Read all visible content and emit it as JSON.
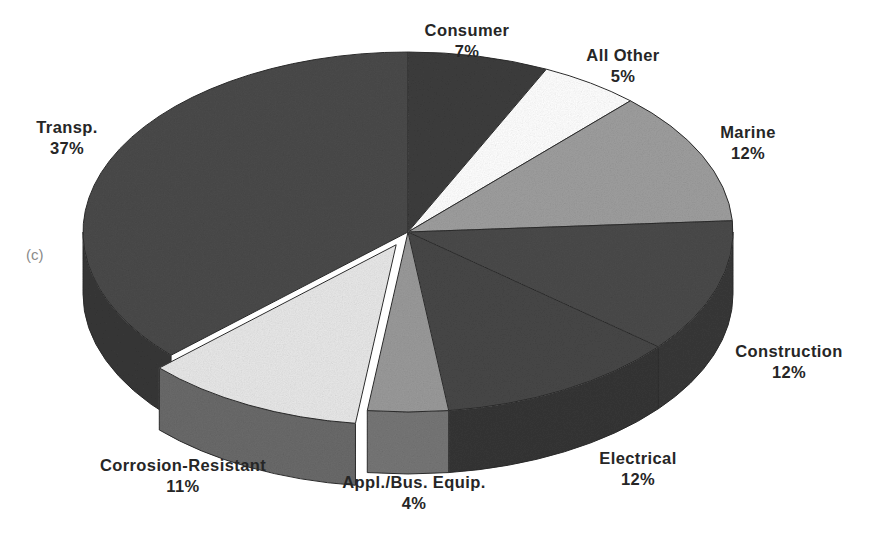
{
  "figure": {
    "tag": "(c)",
    "tag_color": "#8a8a8a"
  },
  "chart_data": {
    "type": "pie",
    "title": "",
    "subtitle": "",
    "xlabel": "",
    "ylabel": "",
    "legend_position": "none",
    "grid": false,
    "three_d": true,
    "start_angle_deg": -90,
    "direction": "clockwise",
    "total_percent": 100,
    "categories": [
      "Consumer",
      "All Other",
      "Marine",
      "Construction",
      "Electrical",
      "Appl./Bus. Equip.",
      "Corrosion-Resistant",
      "Transp."
    ],
    "values": [
      7,
      5,
      12,
      12,
      12,
      4,
      11,
      37
    ],
    "labels": [
      "Consumer 7%",
      "All Other 5%",
      "Marine 12%",
      "Construction 12%",
      "Electrical 12%",
      "Appl./Bus. Equip. 4%",
      "Corrosion-Resistant 11%",
      "Transp. 37%"
    ],
    "colors": [
      "#3d3d3d",
      "#ffffff",
      "#9e9e9e",
      "#4a4a4a",
      "#474747",
      "#9a9a9a",
      "#e8e8e8",
      "#4a4a4a"
    ],
    "exploded": [
      false,
      false,
      false,
      false,
      false,
      false,
      true,
      false
    ]
  },
  "slices": [
    {
      "key": "consumer",
      "name": "Consumer",
      "pct": "7%",
      "value": 7,
      "color": "#3d3d3d",
      "side_color": "#2e2e2e",
      "exploded": false,
      "label_x": 467,
      "label_y": 20,
      "label_align": "center"
    },
    {
      "key": "all-other",
      "name": "All Other",
      "pct": "5%",
      "value": 5,
      "color": "#ffffff",
      "side_color": "#c9c9c9",
      "exploded": false,
      "label_x": 623,
      "label_y": 45,
      "label_align": "center"
    },
    {
      "key": "marine",
      "name": "Marine",
      "pct": "12%",
      "value": 12,
      "color": "#9e9e9e",
      "side_color": "#7a7a7a",
      "exploded": false,
      "label_x": 748,
      "label_y": 122,
      "label_align": "center"
    },
    {
      "key": "construction",
      "name": "Construction",
      "pct": "12%",
      "value": 12,
      "color": "#4a4a4a",
      "side_color": "#383838",
      "exploded": false,
      "label_x": 789,
      "label_y": 341,
      "label_align": "center"
    },
    {
      "key": "electrical",
      "name": "Electrical",
      "pct": "12%",
      "value": 12,
      "color": "#474747",
      "side_color": "#353535",
      "exploded": false,
      "label_x": 638,
      "label_y": 448,
      "label_align": "center"
    },
    {
      "key": "appl-bus-equip",
      "name": "Appl./Bus. Equip.",
      "pct": "4%",
      "value": 4,
      "color": "#9a9a9a",
      "side_color": "#767676",
      "exploded": false,
      "label_x": 414,
      "label_y": 472,
      "label_align": "center"
    },
    {
      "key": "corrosion-resistant",
      "name": "Corrosion-Resistant",
      "pct": "11%",
      "value": 11,
      "color": "#e8e8e8",
      "side_color": "#6a6a6a",
      "exploded": true,
      "label_x": 183,
      "label_y": 455,
      "label_align": "center"
    },
    {
      "key": "transp",
      "name": "Transp.",
      "pct": "37%",
      "value": 37,
      "color": "#4a4a4a",
      "side_color": "#373737",
      "exploded": false,
      "label_x": 67,
      "label_y": 117,
      "label_align": "center"
    }
  ]
}
